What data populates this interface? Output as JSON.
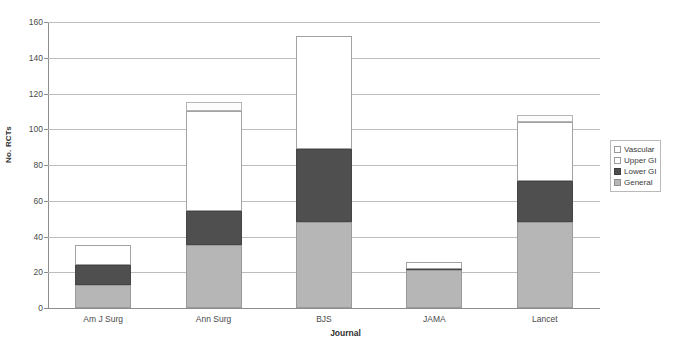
{
  "chart_data": {
    "type": "bar",
    "subtype": "stacked-bar",
    "title": "",
    "xlabel": "Journal",
    "ylabel": "No. RCTs",
    "categories": [
      "Am J Surg",
      "Ann Surg",
      "BJS",
      "JAMA",
      "Lancet"
    ],
    "series": [
      {
        "name": "General",
        "color": "#b6b6b6",
        "values": [
          13,
          35,
          48,
          21,
          48
        ]
      },
      {
        "name": "Lower GI",
        "color": "#4f4f4f",
        "values": [
          11,
          19,
          41,
          1,
          23
        ]
      },
      {
        "name": "Upper GI",
        "color": "#ffffff",
        "values": [
          11,
          56,
          63,
          4,
          33
        ]
      },
      {
        "name": "Vascular",
        "color": "#fdfdfd",
        "values": [
          0,
          5,
          0,
          0,
          4
        ]
      }
    ],
    "totals": [
      35,
      115,
      152,
      26,
      108
    ],
    "ylim": [
      0,
      160
    ],
    "yticks": [
      0,
      20,
      40,
      60,
      80,
      100,
      120,
      140,
      160
    ],
    "ytick_labels": [
      "0",
      "20",
      "40",
      "60",
      "80",
      "100",
      "120",
      "140",
      "160"
    ],
    "grid": true,
    "grid_axis": "y",
    "legend_position": "right",
    "legend_entries": [
      "Vascular",
      "Upper GI",
      "Lower GI",
      "General"
    ]
  },
  "axes": {
    "y_title": "No. RCTs",
    "x_title": "Journal"
  },
  "legend": {
    "items": [
      {
        "label": "Vascular",
        "swatch": "vascular-swatch-icon"
      },
      {
        "label": "Upper GI",
        "swatch": "upper-gi-swatch-icon"
      },
      {
        "label": "Lower GI",
        "swatch": "lower-gi-swatch-icon"
      },
      {
        "label": "General",
        "swatch": "general-swatch-icon"
      }
    ]
  }
}
